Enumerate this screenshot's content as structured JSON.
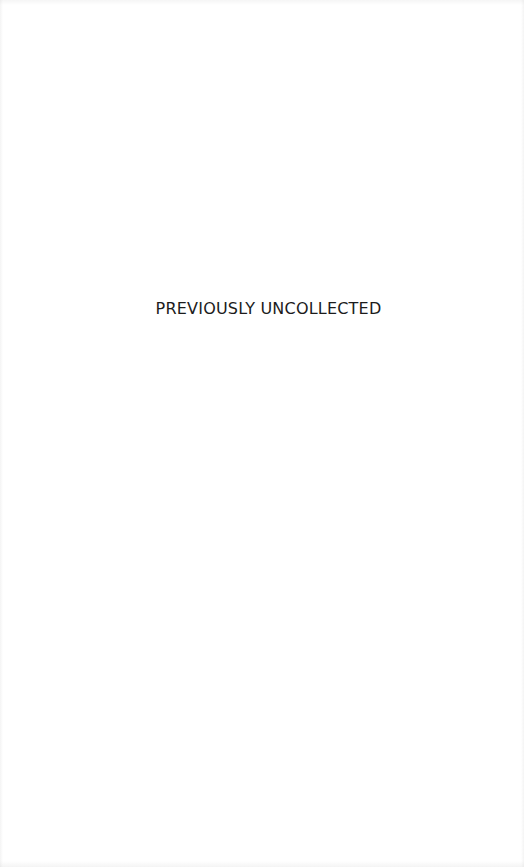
{
  "page": {
    "section_title": "PREVIOUSLY UNCOLLECTED",
    "text_color": "#1c1c1c",
    "background_color": "#ffffff"
  }
}
